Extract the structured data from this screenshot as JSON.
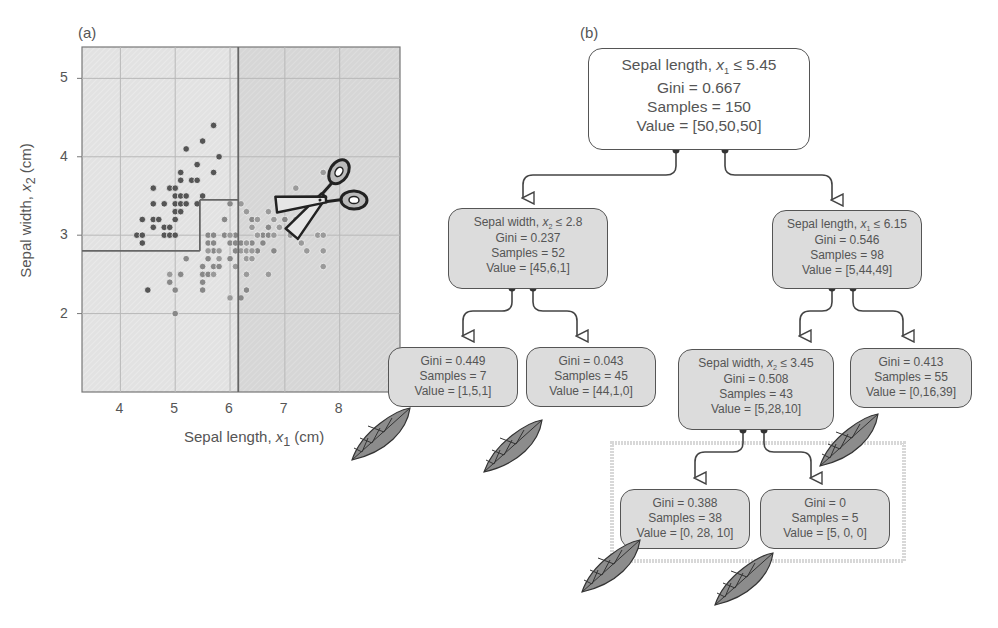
{
  "panels": {
    "a_label": "(a)",
    "b_label": "(b)"
  },
  "colors": {
    "plot_bg_left": "#e4e4e4",
    "plot_bg_right": "#d8d8d8",
    "grid": "#b8b8b8",
    "boundary": "#666666",
    "class_setosa": "#555555",
    "class_versicolor": "#888888",
    "class_virginica": "#9a9a9a",
    "node_fill": "#dcdcdc",
    "node_border": "#555555",
    "leaf_fill": "#8a8a8a",
    "text": "#555555"
  },
  "chart_data": {
    "type": "scatter",
    "title": "",
    "xlabel": "Sepal length, x1 (cm)",
    "ylabel": "Sepal width, x2 (cm)",
    "xlim": [
      3.3,
      9.1
    ],
    "ylim": [
      1.0,
      5.4
    ],
    "xticks": [
      4,
      5,
      6,
      7,
      8
    ],
    "yticks": [
      2,
      3,
      4,
      5
    ],
    "grid": true,
    "decision_boundaries": [
      {
        "type": "vertical",
        "x": 5.45,
        "y_from": 2.8,
        "y_to": 3.45
      },
      {
        "type": "horizontal",
        "y": 2.8,
        "x_from": 3.3,
        "x_to": 5.45
      },
      {
        "type": "horizontal",
        "y": 3.45,
        "x_from": 5.45,
        "x_to": 6.15
      },
      {
        "type": "vertical",
        "x": 6.15,
        "y_from": 1.0,
        "y_to": 5.4
      }
    ],
    "series": [
      {
        "name": "setosa",
        "points": [
          [
            4.3,
            3.0
          ],
          [
            4.4,
            3.0
          ],
          [
            4.4,
            2.9
          ],
          [
            4.4,
            3.2
          ],
          [
            4.5,
            2.3
          ],
          [
            4.6,
            3.1
          ],
          [
            4.6,
            3.2
          ],
          [
            4.6,
            3.4
          ],
          [
            4.6,
            3.6
          ],
          [
            4.7,
            3.2
          ],
          [
            4.8,
            3.0
          ],
          [
            4.8,
            3.1
          ],
          [
            4.8,
            3.4
          ],
          [
            4.9,
            3.0
          ],
          [
            4.9,
            3.1
          ],
          [
            4.9,
            3.6
          ],
          [
            5.0,
            3.0
          ],
          [
            5.0,
            3.2
          ],
          [
            5.0,
            3.3
          ],
          [
            5.0,
            3.4
          ],
          [
            5.0,
            3.5
          ],
          [
            5.0,
            3.6
          ],
          [
            5.1,
            3.3
          ],
          [
            5.1,
            3.4
          ],
          [
            5.1,
            3.5
          ],
          [
            5.1,
            3.7
          ],
          [
            5.1,
            3.8
          ],
          [
            5.2,
            3.4
          ],
          [
            5.2,
            3.5
          ],
          [
            5.2,
            4.1
          ],
          [
            5.3,
            3.7
          ],
          [
            5.4,
            3.4
          ],
          [
            5.4,
            3.7
          ],
          [
            5.4,
            3.9
          ],
          [
            5.5,
            3.5
          ],
          [
            5.5,
            4.2
          ],
          [
            5.7,
            3.8
          ],
          [
            5.7,
            4.4
          ],
          [
            5.8,
            4.0
          ]
        ]
      },
      {
        "name": "versicolor",
        "points": [
          [
            4.9,
            2.4
          ],
          [
            5.0,
            2.0
          ],
          [
            5.0,
            2.3
          ],
          [
            5.1,
            2.5
          ],
          [
            5.2,
            2.7
          ],
          [
            5.5,
            2.3
          ],
          [
            5.5,
            2.4
          ],
          [
            5.5,
            2.5
          ],
          [
            5.5,
            2.6
          ],
          [
            5.6,
            2.5
          ],
          [
            5.6,
            2.7
          ],
          [
            5.6,
            2.9
          ],
          [
            5.6,
            3.0
          ],
          [
            5.7,
            2.6
          ],
          [
            5.7,
            2.8
          ],
          [
            5.7,
            2.9
          ],
          [
            5.7,
            3.0
          ],
          [
            5.8,
            2.6
          ],
          [
            5.8,
            2.7
          ],
          [
            5.9,
            3.0
          ],
          [
            5.9,
            3.2
          ],
          [
            6.0,
            2.2
          ],
          [
            6.0,
            2.7
          ],
          [
            6.0,
            2.9
          ],
          [
            6.0,
            3.4
          ],
          [
            6.1,
            2.8
          ],
          [
            6.1,
            2.9
          ],
          [
            6.1,
            3.0
          ],
          [
            6.2,
            2.2
          ],
          [
            6.2,
            2.9
          ],
          [
            6.3,
            2.3
          ],
          [
            6.3,
            2.5
          ],
          [
            6.3,
            3.3
          ],
          [
            6.4,
            2.9
          ],
          [
            6.4,
            3.2
          ],
          [
            6.5,
            2.8
          ],
          [
            6.6,
            2.9
          ],
          [
            6.6,
            3.0
          ],
          [
            6.7,
            3.0
          ],
          [
            6.7,
            3.1
          ],
          [
            6.8,
            2.8
          ],
          [
            6.9,
            3.1
          ],
          [
            7.0,
            3.2
          ]
        ]
      },
      {
        "name": "virginica",
        "points": [
          [
            4.9,
            2.5
          ],
          [
            5.6,
            2.8
          ],
          [
            5.7,
            2.5
          ],
          [
            5.8,
            2.7
          ],
          [
            5.8,
            2.8
          ],
          [
            6.0,
            2.2
          ],
          [
            6.0,
            3.0
          ],
          [
            6.1,
            2.6
          ],
          [
            6.2,
            2.8
          ],
          [
            6.2,
            3.4
          ],
          [
            6.3,
            2.5
          ],
          [
            6.3,
            2.7
          ],
          [
            6.3,
            2.8
          ],
          [
            6.3,
            2.9
          ],
          [
            6.3,
            3.3
          ],
          [
            6.4,
            2.7
          ],
          [
            6.4,
            2.8
          ],
          [
            6.4,
            3.1
          ],
          [
            6.5,
            3.0
          ],
          [
            6.5,
            3.2
          ],
          [
            6.7,
            2.5
          ],
          [
            6.7,
            3.3
          ],
          [
            6.8,
            3.0
          ],
          [
            6.8,
            3.2
          ],
          [
            6.9,
            3.1
          ],
          [
            7.1,
            3.0
          ],
          [
            7.2,
            3.0
          ],
          [
            7.2,
            3.2
          ],
          [
            7.2,
            3.6
          ],
          [
            7.3,
            2.9
          ],
          [
            7.4,
            2.8
          ],
          [
            7.6,
            3.0
          ],
          [
            7.7,
            2.6
          ],
          [
            7.7,
            2.8
          ],
          [
            7.7,
            3.0
          ],
          [
            7.7,
            3.8
          ],
          [
            7.9,
            3.8
          ]
        ]
      }
    ],
    "annotations": [
      "scissors icon at split x1 = 6.15"
    ]
  },
  "axes": {
    "xlabel_text": "Sepal length, ",
    "xlabel_var": "x",
    "xlabel_sub": "1",
    "xlabel_unit": " (cm)",
    "ylabel_text": "Sepal width, ",
    "ylabel_var": "x",
    "ylabel_sub": "2",
    "ylabel_unit": " (cm)",
    "xticks": [
      "4",
      "5",
      "6",
      "7",
      "8"
    ],
    "yticks": [
      "2",
      "3",
      "4",
      "5"
    ]
  },
  "tree": {
    "root": {
      "cond_text": "Sepal length, ",
      "cond_var": "x",
      "cond_sub": "1",
      "cond_op": " ≤ 5.45",
      "gini": "Gini = 0.667",
      "samples": "Samples = 150",
      "value": "Value = [50,50,50]"
    },
    "left": {
      "cond_text": "Sepal width, ",
      "cond_var": "x",
      "cond_sub": "2",
      "cond_op": " ≤ 2.8",
      "gini": "Gini = 0.237",
      "samples": "Samples = 52",
      "value": "Value = [45,6,1]"
    },
    "right": {
      "cond_text": "Sepal length, ",
      "cond_var": "x",
      "cond_sub": "1",
      "cond_op": " ≤ 6.15",
      "gini": "Gini = 0.546",
      "samples": "Samples = 98",
      "value": "Value = [5,44,49]"
    },
    "left_left": {
      "gini": "Gini = 0.449",
      "samples": "Samples = 7",
      "value": "Value = [1,5,1]"
    },
    "left_right": {
      "gini": "Gini = 0.043",
      "samples": "Samples = 45",
      "value": "Value = [44,1,0]"
    },
    "right_left": {
      "cond_text": "Sepal width, ",
      "cond_var": "x",
      "cond_sub": "2",
      "cond_op": " ≤ 3.45",
      "gini": "Gini = 0.508",
      "samples": "Samples = 43",
      "value": "Value = [5,28,10]"
    },
    "right_right": {
      "gini": "Gini = 0.413",
      "samples": "Samples = 55",
      "value": "Value = [0,16,39]"
    },
    "rl_left": {
      "gini": "Gini = 0.388",
      "samples": "Samples = 38",
      "value": "Value = [0, 28, 10]"
    },
    "rl_right": {
      "gini": "Gini = 0",
      "samples": "Samples = 5",
      "value": "Value = [5, 0, 0]"
    }
  }
}
